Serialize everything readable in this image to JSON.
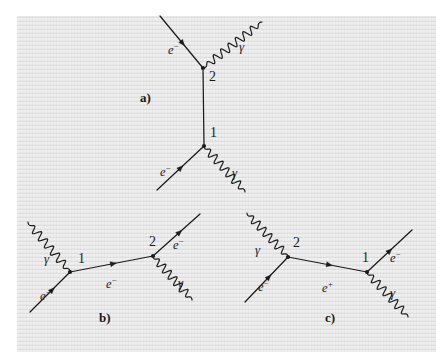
{
  "figure": {
    "kind": "feynman-diagrams",
    "background_color": "#e9e9e9",
    "ink_color": "#1b1b1b",
    "panels": [
      {
        "id": "a",
        "label": "a)",
        "label_pos": [
          140,
          91
        ],
        "description": "Vertical internal electron line joining two vertices; vertex 2 above, vertex 1 below.",
        "vertices": [
          {
            "name": "2",
            "label": "2",
            "x": 203,
            "y": 68,
            "label_dx": 6,
            "label_dy": 2
          },
          {
            "name": "1",
            "label": "1",
            "x": 204,
            "y": 146,
            "label_dx": 6,
            "label_dy": -20
          }
        ],
        "lines": [
          {
            "name": "electron-in-upper",
            "type": "fermion",
            "x1": 160,
            "y1": 16,
            "x2": 203,
            "y2": 68,
            "arrow_t": 0.52
          },
          {
            "name": "internal-electron",
            "type": "fermion",
            "x1": 203,
            "y1": 68,
            "x2": 204,
            "y2": 146,
            "arrow_t": -1
          },
          {
            "name": "electron-in-lower",
            "type": "fermion",
            "x1": 157,
            "y1": 190,
            "x2": 204,
            "y2": 146,
            "arrow_t": 0.5
          },
          {
            "name": "photon-upper",
            "type": "photon",
            "x1": 203,
            "y1": 68,
            "x2": 262,
            "y2": 22,
            "amplitude": 4.0,
            "wavelength": 9.0
          },
          {
            "name": "photon-lower",
            "type": "photon",
            "x1": 204,
            "y1": 146,
            "x2": 245,
            "y2": 192,
            "amplitude": 4.0,
            "wavelength": 9.0
          }
        ],
        "labels": [
          {
            "name": "electron-label-upper",
            "text": "e",
            "sup": "−",
            "x": 168,
            "y": 42,
            "kind": "particle"
          },
          {
            "name": "photon-label-upper",
            "text": "γ",
            "x": 239,
            "y": 40,
            "kind": "photon"
          },
          {
            "name": "electron-label-lower",
            "text": "e",
            "sup": "−",
            "x": 160,
            "y": 164,
            "kind": "particle"
          },
          {
            "name": "photon-label-lower",
            "text": "γ",
            "x": 232,
            "y": 166,
            "kind": "photon"
          }
        ]
      },
      {
        "id": "b",
        "label": "b)",
        "label_pos": [
          99,
          311
        ],
        "description": "Horizontal internal electron line; incoming photon at vertex 1 on the left, outgoing photon at vertex 2 on the right.",
        "vertices": [
          {
            "name": "1",
            "label": "1",
            "x": 70,
            "y": 272,
            "label_dx": 8,
            "label_dy": -20
          },
          {
            "name": "2",
            "label": "2",
            "x": 153,
            "y": 256,
            "label_dx": -4,
            "label_dy": -21
          }
        ],
        "lines": [
          {
            "name": "electron-in",
            "type": "fermion",
            "x1": 30,
            "y1": 312,
            "x2": 70,
            "y2": 272,
            "arrow_t": 0.55
          },
          {
            "name": "internal-electron",
            "type": "fermion",
            "x1": 70,
            "y1": 272,
            "x2": 153,
            "y2": 256,
            "arrow_t": 0.52
          },
          {
            "name": "electron-out",
            "type": "fermion",
            "x1": 153,
            "y1": 256,
            "x2": 200,
            "y2": 214,
            "arrow_t": 0.56
          },
          {
            "name": "photon-in",
            "type": "photon",
            "x1": 70,
            "y1": 272,
            "x2": 28,
            "y2": 222,
            "amplitude": 4.0,
            "wavelength": 9.0
          },
          {
            "name": "photon-out",
            "type": "photon",
            "x1": 153,
            "y1": 256,
            "x2": 192,
            "y2": 300,
            "amplitude": 4.0,
            "wavelength": 9.0
          }
        ],
        "labels": [
          {
            "name": "photon-label-in",
            "text": "γ",
            "x": 44,
            "y": 252,
            "kind": "photon"
          },
          {
            "name": "electron-label-in",
            "text": "e",
            "sup": "−",
            "x": 40,
            "y": 288,
            "kind": "particle"
          },
          {
            "name": "internal-electron-label",
            "text": "e",
            "sup": "−",
            "x": 106,
            "y": 276,
            "kind": "particle"
          },
          {
            "name": "electron-label-out",
            "text": "e",
            "sup": "−",
            "x": 173,
            "y": 237,
            "kind": "particle"
          },
          {
            "name": "photon-label-out",
            "text": "γ",
            "x": 178,
            "y": 276,
            "kind": "photon"
          }
        ]
      },
      {
        "id": "c",
        "label": "c)",
        "label_pos": [
          325,
          311
        ],
        "description": "Horizontal internal positron line; incoming photon at vertex 2 on the left, outgoing photon at vertex 1 on the right.",
        "vertices": [
          {
            "name": "2",
            "label": "2",
            "x": 288,
            "y": 257,
            "label_dx": 5,
            "label_dy": -21
          },
          {
            "name": "1",
            "label": "1",
            "x": 367,
            "y": 272,
            "label_dx": -5,
            "label_dy": -21
          }
        ],
        "lines": [
          {
            "name": "electron-in",
            "type": "fermion",
            "x1": 245,
            "y1": 302,
            "x2": 288,
            "y2": 257,
            "arrow_t": 0.55
          },
          {
            "name": "internal-positron",
            "type": "fermion",
            "x1": 288,
            "y1": 257,
            "x2": 367,
            "y2": 272,
            "arrow_t": 0.52
          },
          {
            "name": "electron-out",
            "type": "fermion",
            "x1": 367,
            "y1": 272,
            "x2": 412,
            "y2": 230,
            "arrow_t": 0.5
          },
          {
            "name": "photon-in",
            "type": "photon",
            "x1": 288,
            "y1": 257,
            "x2": 247,
            "y2": 213,
            "amplitude": 4.0,
            "wavelength": 9.0
          },
          {
            "name": "photon-out",
            "type": "photon",
            "x1": 367,
            "y1": 272,
            "x2": 408,
            "y2": 317,
            "amplitude": 4.0,
            "wavelength": 9.0
          }
        ],
        "labels": [
          {
            "name": "photon-label-in",
            "text": "γ",
            "x": 255,
            "y": 243,
            "kind": "photon"
          },
          {
            "name": "electron-label-in",
            "text": "e",
            "sup": "−",
            "x": 258,
            "y": 279,
            "kind": "particle"
          },
          {
            "name": "internal-positron-label",
            "text": "e",
            "sup": "+",
            "x": 322,
            "y": 280,
            "kind": "particle"
          },
          {
            "name": "electron-label-out",
            "text": "e",
            "sup": "−",
            "x": 390,
            "y": 250,
            "kind": "particle"
          },
          {
            "name": "photon-label-out",
            "text": "γ",
            "x": 390,
            "y": 286,
            "kind": "photon"
          }
        ]
      }
    ]
  }
}
